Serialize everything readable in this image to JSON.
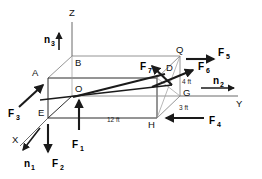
{
  "figure": {
    "type": "engineering-mechanics-diagram",
    "background_color": "#ffffff",
    "line_color": "#1a1a1a"
  },
  "axes": [
    {
      "id": "z",
      "label": "Z",
      "direction": "up"
    },
    {
      "id": "y",
      "label": "Y",
      "direction": "right"
    },
    {
      "id": "x",
      "label": "X",
      "direction": "down-left"
    }
  ],
  "unit_vectors": [
    {
      "id": "n1",
      "base": "n",
      "sub": "1",
      "direction": "down-left"
    },
    {
      "id": "n2",
      "base": "n",
      "sub": "2",
      "direction": "right"
    },
    {
      "id": "n3",
      "base": "n",
      "sub": "3",
      "direction": "up"
    }
  ],
  "forces": [
    {
      "id": "F1",
      "base": "F",
      "sub": "1",
      "direction": "up"
    },
    {
      "id": "F2",
      "base": "F",
      "sub": "2",
      "direction": "down"
    },
    {
      "id": "F3",
      "base": "F",
      "sub": "3",
      "direction": "up-right"
    },
    {
      "id": "F4",
      "base": "F",
      "sub": "4",
      "direction": "left"
    },
    {
      "id": "F5",
      "base": "F",
      "sub": "5",
      "direction": "right"
    },
    {
      "id": "F6",
      "base": "F",
      "sub": "6",
      "direction": "up-right"
    },
    {
      "id": "F7",
      "base": "F",
      "sub": "7",
      "direction": "up-left"
    }
  ],
  "vertices": [
    {
      "id": "A",
      "label": "A"
    },
    {
      "id": "B",
      "label": "B"
    },
    {
      "id": "D",
      "label": "D"
    },
    {
      "id": "E",
      "label": "E"
    },
    {
      "id": "G",
      "label": "G"
    },
    {
      "id": "H",
      "label": "H"
    },
    {
      "id": "O",
      "label": "O"
    },
    {
      "id": "Q",
      "label": "Q"
    }
  ],
  "dimensions": [
    {
      "id": "length",
      "label": "12 ft"
    },
    {
      "id": "height",
      "label": "4 ft"
    },
    {
      "id": "depth",
      "label": "3 ft"
    }
  ]
}
